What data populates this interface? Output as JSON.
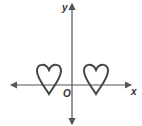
{
  "diagram": {
    "type": "coordinate-plane",
    "axes": {
      "x_label": "x",
      "y_label": "y",
      "origin_label": "O"
    },
    "shapes": [
      {
        "name": "left-heart",
        "description": "heart outline left of y-axis, straddling x-axis"
      },
      {
        "name": "right-heart",
        "description": "heart outline right of y-axis, straddling x-axis"
      }
    ],
    "colors": {
      "axis": "#555555",
      "shape": "#444444",
      "background": "#ffffff"
    }
  }
}
